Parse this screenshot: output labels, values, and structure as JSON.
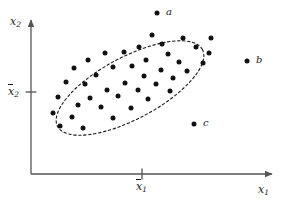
{
  "chart_data": {
    "type": "scatter",
    "title": "",
    "xlabel": "x1",
    "ylabel": "x2",
    "grid": false,
    "legend": "none",
    "axes": {
      "origin_px": [
        31,
        174
      ],
      "x_axis_end_px": [
        277,
        174
      ],
      "y_axis_end_px": [
        31,
        15
      ],
      "x_tick_px": 142,
      "y_tick_px": 92
    },
    "tick_labels": {
      "x_mean": "x1",
      "y_mean": "x2"
    },
    "confidence_ellipse": {
      "center_px": [
        130,
        88
      ],
      "rx_px": 82,
      "ry_px": 31,
      "rotation_deg": -28,
      "style": "dashed"
    },
    "cluster_points_px": [
      [
        152,
        35
      ],
      [
        183,
        38
      ],
      [
        211,
        38
      ],
      [
        162,
        44
      ],
      [
        139,
        47
      ],
      [
        196,
        47
      ],
      [
        105,
        53
      ],
      [
        124,
        52
      ],
      [
        168,
        54
      ],
      [
        209,
        53
      ],
      [
        88,
        60
      ],
      [
        146,
        60
      ],
      [
        179,
        62
      ],
      [
        203,
        63
      ],
      [
        74,
        68
      ],
      [
        113,
        67
      ],
      [
        132,
        66
      ],
      [
        161,
        70
      ],
      [
        187,
        71
      ],
      [
        96,
        75
      ],
      [
        144,
        76
      ],
      [
        173,
        78
      ],
      [
        66,
        82
      ],
      [
        85,
        84
      ],
      [
        125,
        83
      ],
      [
        156,
        84
      ],
      [
        107,
        90
      ],
      [
        138,
        90
      ],
      [
        170,
        91
      ],
      [
        58,
        97
      ],
      [
        90,
        98
      ],
      [
        118,
        96
      ],
      [
        148,
        99
      ],
      [
        78,
        105
      ],
      [
        101,
        107
      ],
      [
        131,
        108
      ],
      [
        53,
        113
      ],
      [
        72,
        117
      ],
      [
        113,
        118
      ],
      [
        60,
        126
      ],
      [
        83,
        128
      ]
    ],
    "outlier_points": [
      {
        "label": "a",
        "px": [
          157,
          13
        ],
        "label_px": [
          166,
          7
        ]
      },
      {
        "label": "b",
        "px": [
          247,
          61
        ],
        "label_px": [
          256,
          55
        ]
      },
      {
        "label": "c",
        "px": [
          194,
          124
        ],
        "label_px": [
          203,
          118
        ]
      }
    ],
    "point_color": "#111111",
    "axis_color": "#555555",
    "ellipse_color": "#1a1a1a"
  },
  "labels": {
    "y_axis": "x",
    "y_axis_sub": "2",
    "x_axis": "x",
    "x_axis_sub": "1",
    "y_tick": "x",
    "y_tick_sub": "2",
    "x_tick": "x",
    "x_tick_sub": "1",
    "point_a": "a",
    "point_b": "b",
    "point_c": "c"
  }
}
